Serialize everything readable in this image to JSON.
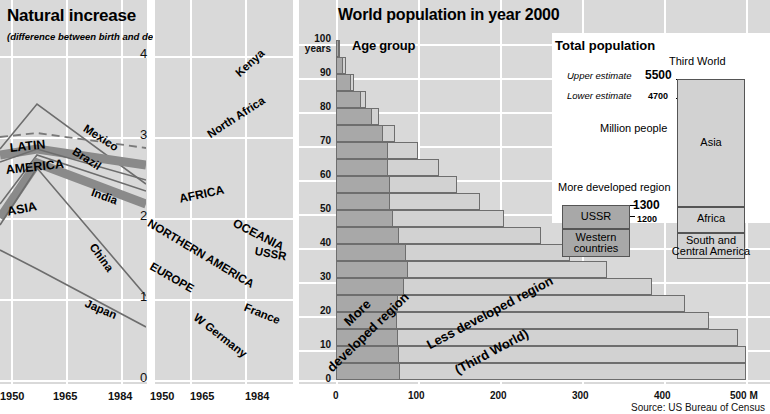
{
  "left_chart": {
    "title": "Natural increase",
    "subtitle": "(difference between birth and death rate)",
    "y_ticks": [
      "4",
      "3",
      "2",
      "1",
      "0"
    ],
    "x_ticks": [
      "1950",
      "1965",
      "1984"
    ],
    "series": [
      {
        "name": "Mexico",
        "style": "thin"
      },
      {
        "name": "LATIN",
        "style": "region"
      },
      {
        "name": "AMERICA",
        "style": "region"
      },
      {
        "name": "Brazil",
        "style": "thin"
      },
      {
        "name": "India",
        "style": "thin"
      },
      {
        "name": "ASIA",
        "style": "region"
      },
      {
        "name": "China",
        "style": "thin"
      },
      {
        "name": "Japan",
        "style": "thin"
      }
    ]
  },
  "mid_chart": {
    "y_ticks": [
      "4",
      "3",
      "2",
      "1",
      "0"
    ],
    "x_ticks": [
      "1950",
      "1965",
      "1984"
    ],
    "series": [
      {
        "name": "Kenya",
        "style": "thin"
      },
      {
        "name": "North Africa",
        "style": "thin"
      },
      {
        "name": "AFRICA",
        "style": "region"
      },
      {
        "name": "OCEANIA",
        "style": "dashed"
      },
      {
        "name": "NORTHERN AMERICA",
        "style": "region"
      },
      {
        "name": "USSR",
        "style": "thin"
      },
      {
        "name": "EUROPE",
        "style": "region"
      },
      {
        "name": "France",
        "style": "dotted"
      },
      {
        "name": "W Germany",
        "style": "thin"
      }
    ]
  },
  "right_chart": {
    "title": "World population in year 2000",
    "age_group_label": "Age group",
    "y_unit": "100\nyears",
    "y_ticks": [
      "100",
      "90",
      "80",
      "70",
      "60",
      "50",
      "40",
      "30",
      "20",
      "10",
      "0"
    ],
    "y_unit_label": "years",
    "x_ticks": [
      "0",
      "100",
      "200",
      "300",
      "400",
      "500 M"
    ],
    "region_more_label": "More\ndeveloped region",
    "region_more_l1": "More",
    "region_more_l2": "developed region",
    "region_less_l1": "Less developed region",
    "region_less_l2": "(Third World)",
    "source": "Source: US Bureau of Census",
    "pyramid": [
      {
        "age": "95-100",
        "more": 4,
        "less": 5
      },
      {
        "age": "90-95",
        "more": 9,
        "less": 12
      },
      {
        "age": "85-90",
        "more": 18,
        "less": 22
      },
      {
        "age": "80-85",
        "more": 30,
        "less": 36
      },
      {
        "age": "75-80",
        "more": 44,
        "less": 52
      },
      {
        "age": "70-75",
        "more": 57,
        "less": 72
      },
      {
        "age": "65-70",
        "more": 63,
        "less": 100
      },
      {
        "age": "60-65",
        "more": 63,
        "less": 125
      },
      {
        "age": "55-60",
        "more": 66,
        "less": 148
      },
      {
        "age": "50-55",
        "more": 66,
        "less": 175
      },
      {
        "age": "45-50",
        "more": 70,
        "less": 205
      },
      {
        "age": "40-45",
        "more": 77,
        "less": 250
      },
      {
        "age": "35-40",
        "more": 85,
        "less": 285
      },
      {
        "age": "30-35",
        "more": 88,
        "less": 330
      },
      {
        "age": "25-30",
        "more": 83,
        "less": 385
      },
      {
        "age": "20-25",
        "more": 76,
        "less": 425
      },
      {
        "age": "15-20",
        "more": 74,
        "less": 455
      },
      {
        "age": "10-15",
        "more": 75,
        "less": 490
      },
      {
        "age": "5-10",
        "more": 77,
        "less": 500
      },
      {
        "age": "0-5",
        "more": 78,
        "less": 500
      }
    ]
  },
  "inset": {
    "title": "Total population",
    "upper_estimate_label": "Upper estimate",
    "lower_estimate_label": "Lower estimate",
    "unit_label": "Million people",
    "more_developed_label": "More developed region",
    "third_world_label": "Third World",
    "tw_upper": "5500",
    "tw_lower": "4700",
    "md_upper": "1300",
    "md_lower": "1200",
    "blocks_more": [
      {
        "label": "USSR"
      },
      {
        "label": "Western\ncountries",
        "l1": "Western",
        "l2": "countries"
      }
    ],
    "blocks_third": [
      {
        "label": "Asia"
      },
      {
        "label": "Africa"
      },
      {
        "label": "South and\nCentral America",
        "l1": "South and",
        "l2": "Central America"
      }
    ]
  },
  "chart_data": [
    {
      "type": "line",
      "title": "Natural increase",
      "subtitle": "(difference between birth and death rate)",
      "xlabel": "",
      "ylabel": "difference between birth and death rate (%)",
      "x": [
        1950,
        1965,
        1984
      ],
      "xlim": [
        1950,
        1984
      ],
      "ylim": [
        0,
        4
      ],
      "grid": true,
      "series": [
        {
          "name": "Mexico",
          "values": [
            2.85,
            3.42,
            2.55
          ],
          "style": "thin"
        },
        {
          "name": "LATIN AMERICA",
          "values": [
            2.7,
            2.88,
            2.25
          ],
          "style": "dashed-region"
        },
        {
          "name": "Brazil",
          "values": [
            2.55,
            2.88,
            2.28
          ],
          "style": "thin"
        },
        {
          "name": "ASIA",
          "values": [
            2.0,
            2.55,
            1.95
          ],
          "style": "thick-region"
        },
        {
          "name": "India",
          "values": [
            1.85,
            2.55,
            2.12
          ],
          "style": "thin"
        },
        {
          "name": "China",
          "values": [
            1.8,
            2.55,
            1.05
          ],
          "style": "thin"
        },
        {
          "name": "Japan",
          "values": [
            1.6,
            1.1,
            0.65
          ],
          "style": "thin"
        }
      ]
    },
    {
      "type": "line",
      "title": "",
      "x": [
        1950,
        1965,
        1984
      ],
      "xlim": [
        1950,
        1984
      ],
      "ylim": [
        0,
        4
      ],
      "grid": true,
      "series": [
        {
          "name": "Kenya",
          "values": [
            2.35,
            3.05,
            3.85
          ],
          "style": "thin"
        },
        {
          "name": "North Africa",
          "values": [
            2.3,
            2.6,
            3.1
          ],
          "style": "thin"
        },
        {
          "name": "AFRICA",
          "values": [
            2.05,
            2.45,
            2.6
          ],
          "style": "thick-region"
        },
        {
          "name": "OCEANIA",
          "values": [
            2.2,
            1.95,
            1.35
          ],
          "style": "dashed"
        },
        {
          "name": "NORTHERN AMERICA",
          "values": [
            2.0,
            1.55,
            0.7
          ],
          "style": "thick-region"
        },
        {
          "name": "USSR",
          "values": [
            2.0,
            1.52,
            0.92
          ],
          "style": "thin"
        },
        {
          "name": "EUROPE",
          "values": [
            1.5,
            1.2,
            0.42
          ],
          "style": "thick-region"
        },
        {
          "name": "France",
          "values": [
            1.05,
            1.0,
            0.55
          ],
          "style": "dotted"
        },
        {
          "name": "W Germany",
          "values": [
            1.05,
            0.95,
            0.05
          ],
          "style": "thin"
        }
      ]
    },
    {
      "type": "bar",
      "orientation": "horizontal",
      "title": "World population in year 2000",
      "xlabel": "Million people",
      "ylabel": "Age group (years)",
      "xlim": [
        0,
        500
      ],
      "ylim": [
        0,
        100
      ],
      "grid": true,
      "categories": [
        "0-5",
        "5-10",
        "10-15",
        "15-20",
        "20-25",
        "25-30",
        "30-35",
        "35-40",
        "40-45",
        "45-50",
        "50-55",
        "55-60",
        "60-65",
        "65-70",
        "70-75",
        "75-80",
        "80-85",
        "85-90",
        "90-95",
        "95-100"
      ],
      "series": [
        {
          "name": "More developed region",
          "values": [
            78,
            77,
            75,
            74,
            76,
            83,
            88,
            85,
            77,
            70,
            66,
            66,
            63,
            63,
            57,
            44,
            30,
            18,
            9,
            4
          ]
        },
        {
          "name": "Less developed region (Third World)",
          "values": [
            500,
            500,
            490,
            455,
            425,
            385,
            330,
            285,
            250,
            205,
            175,
            148,
            125,
            100,
            72,
            52,
            36,
            22,
            12,
            5
          ]
        }
      ],
      "source": "Source: US Bureau of Census"
    },
    {
      "type": "bar",
      "title": "Total population",
      "ylabel": "Million people",
      "categories": [
        "More developed region",
        "Third World"
      ],
      "annotations": {
        "upper_estimate": "Upper estimate",
        "lower_estimate": "Lower estimate"
      },
      "series": [
        {
          "name": "More developed region",
          "upper": 1300,
          "lower": 1200,
          "components": [
            "USSR",
            "Western countries"
          ]
        },
        {
          "name": "Third World",
          "upper": 5500,
          "lower": 4700,
          "components": [
            "Asia",
            "Africa",
            "South and Central America"
          ]
        }
      ]
    }
  ]
}
